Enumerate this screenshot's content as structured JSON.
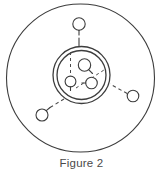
{
  "figure": {
    "caption": "Figure 2",
    "title": "Figure 2",
    "stroke_color": "#3d3d3d",
    "dash_color": "#4a4a4a",
    "background_color": "#ffffff",
    "caption_color": "#4a4a4a"
  },
  "chart_data": {
    "type": "diagram",
    "title": "Figure 2",
    "elements": [
      {
        "id": "outer-boundary-circle",
        "shape": "circle",
        "cx": 80.5,
        "cy": 78,
        "r": 74,
        "stroke": "#3d3d3d",
        "stroke_width": 1.1,
        "fill": "none",
        "style": "solid"
      },
      {
        "id": "annulus-outer-circle",
        "shape": "circle",
        "cx": 81.5,
        "cy": 75,
        "r": 28.5,
        "stroke": "#3d3d3d",
        "stroke_width": 1.3,
        "fill": "none",
        "style": "solid"
      },
      {
        "id": "annulus-inner-circle",
        "shape": "circle",
        "cx": 81.5,
        "cy": 75,
        "r": 24.5,
        "stroke": "#3d3d3d",
        "stroke_width": 1.3,
        "fill": "none",
        "style": "solid"
      },
      {
        "id": "inner-node-top",
        "shape": "circle",
        "cx": 84.5,
        "cy": 65,
        "r": 6.2,
        "stroke": "#3d3d3d",
        "stroke_width": 1.1,
        "fill": "none",
        "style": "solid"
      },
      {
        "id": "inner-node-top-stem",
        "shape": "line",
        "x1": 88.6,
        "y1": 69.6,
        "x2": 92.5,
        "y2": 73.5,
        "stroke": "#3d3d3d",
        "stroke_width": 1.1,
        "style": "solid"
      },
      {
        "id": "inner-node-left",
        "shape": "circle",
        "cx": 70.5,
        "cy": 81.5,
        "r": 5.4,
        "stroke": "#3d3d3d",
        "stroke_width": 1.1,
        "fill": "none",
        "style": "solid"
      },
      {
        "id": "inner-node-left-stem",
        "shape": "line",
        "x1": 70.5,
        "y1": 86.9,
        "x2": 70.5,
        "y2": 90.5,
        "stroke": "#3d3d3d",
        "stroke_width": 1.1,
        "style": "solid"
      },
      {
        "id": "inner-node-right",
        "shape": "circle",
        "cx": 91.5,
        "cy": 83,
        "r": 5.8,
        "stroke": "#3d3d3d",
        "stroke_width": 1.1,
        "fill": "none",
        "style": "solid"
      },
      {
        "id": "inner-node-right-stem",
        "shape": "line",
        "x1": 85.7,
        "y1": 83,
        "x2": 81.8,
        "y2": 83,
        "stroke": "#3d3d3d",
        "stroke_width": 1.1,
        "style": "solid"
      },
      {
        "id": "external-node-top",
        "shape": "circle",
        "cx": 79,
        "cy": 24,
        "r": 6.2,
        "stroke": "#3d3d3d",
        "stroke_width": 1.1,
        "fill": "none",
        "style": "solid"
      },
      {
        "id": "external-node-top-stem",
        "shape": "line",
        "x1": 79,
        "y1": 30.2,
        "x2": 79,
        "y2": 35,
        "stroke": "#3d3d3d",
        "stroke_width": 1.1,
        "style": "solid"
      },
      {
        "id": "leader-top",
        "shape": "line",
        "x1": 79,
        "y1": 38,
        "x2": 79,
        "y2": 47,
        "stroke": "#3d3d3d",
        "stroke_width": 1.1,
        "style": "solid"
      },
      {
        "id": "external-node-right",
        "shape": "circle",
        "cx": 133,
        "cy": 96,
        "r": 5.8,
        "stroke": "#3d3d3d",
        "stroke_width": 1.1,
        "fill": "none",
        "style": "solid"
      },
      {
        "id": "leader-right-dashed",
        "shape": "line",
        "x1": 127.2,
        "y1": 93.5,
        "x2": 110,
        "y2": 84,
        "stroke": "#4a4a4a",
        "stroke_width": 1.1,
        "style": "dashed",
        "dash_pattern": "3.5 3"
      },
      {
        "id": "external-node-bottomleft",
        "shape": "circle",
        "cx": 42,
        "cy": 115,
        "r": 6,
        "stroke": "#3d3d3d",
        "stroke_width": 1.1,
        "fill": "none",
        "style": "solid"
      },
      {
        "id": "external-node-bottomleft-stem",
        "shape": "line",
        "x1": 46.3,
        "y1": 110.7,
        "x2": 50,
        "y2": 107.5,
        "stroke": "#3d3d3d",
        "stroke_width": 1.1,
        "style": "solid"
      },
      {
        "id": "leader-bottomleft-dashed",
        "shape": "line",
        "x1": 50,
        "y1": 107.5,
        "x2": 64,
        "y2": 99,
        "stroke": "#4a4a4a",
        "stroke_width": 1.1,
        "style": "dashed",
        "dash_pattern": "3.5 3"
      },
      {
        "id": "internal-dashed-vertical",
        "shape": "line",
        "x1": 70.5,
        "y1": 52,
        "x2": 70.5,
        "y2": 76,
        "stroke": "#4a4a4a",
        "stroke_width": 1,
        "style": "dashed",
        "dash_pattern": "3 3"
      },
      {
        "id": "internal-dashed-diagonal",
        "shape": "line",
        "x1": 76,
        "y1": 88,
        "x2": 104,
        "y2": 70,
        "stroke": "#4a4a4a",
        "stroke_width": 1,
        "style": "dashed",
        "dash_pattern": "3 3"
      }
    ],
    "counts": {
      "outer_circles": 1,
      "concentric_rings": 2,
      "inner_nodes": 3,
      "external_nodes": 3,
      "dashed_leaders": 2
    }
  }
}
